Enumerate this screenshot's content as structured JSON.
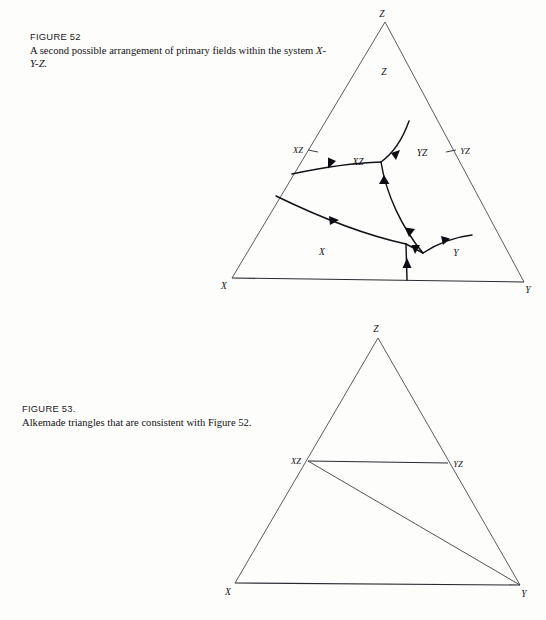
{
  "page": {
    "background": "#fdfdfc",
    "ink": "#121117"
  },
  "figures": [
    {
      "id": "figure-52",
      "caption_head": "FIGURE 52",
      "caption_body_plain": "A second possible arrangement of primary fields within the system ",
      "caption_body_italic": "X-Y-Z.",
      "diagram": {
        "type": "ternary-phase-diagram",
        "corner_labels": {
          "top": "Z",
          "left": "X",
          "right": "Y"
        },
        "edge_labels": [
          {
            "name": "XZ",
            "edge": "left"
          },
          {
            "name": "YZ",
            "edge": "right"
          }
        ],
        "primary_fields": [
          {
            "label": "Z"
          },
          {
            "label": "XZ"
          },
          {
            "label": "YZ"
          },
          {
            "label": "X"
          },
          {
            "label": "Y"
          }
        ],
        "boundary_arrow_count": 8
      }
    },
    {
      "id": "figure-53",
      "caption_head": "FIGURE 53.",
      "caption_body_plain": "Alkemade triangles that are consistent with Figure 52.",
      "caption_body_italic": "",
      "diagram": {
        "type": "alkemade-triangles",
        "corner_labels": {
          "top": "Z",
          "left": "X",
          "right": "Y"
        },
        "compound_labels": [
          {
            "name": "XZ",
            "edge": "left"
          },
          {
            "name": "YZ",
            "edge": "right"
          }
        ],
        "join_lines": [
          {
            "from": "XZ",
            "to": "YZ"
          },
          {
            "from": "XZ",
            "to": "Y"
          }
        ]
      }
    }
  ],
  "colors": {
    "ink": "#121117",
    "edge": "#33323a",
    "paper": "#fdfdfc"
  }
}
